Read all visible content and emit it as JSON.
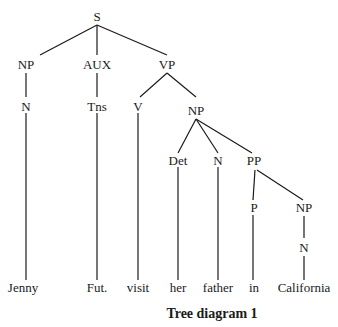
{
  "caption": "Tree diagram 1",
  "nodes": {
    "S": "S",
    "NP1": "NP",
    "AUX": "AUX",
    "VP": "VP",
    "N1": "N",
    "Tns": "Tns",
    "V": "V",
    "NP2": "NP",
    "Det": "Det",
    "N2": "N",
    "PP": "PP",
    "P": "P",
    "NP3": "NP",
    "N3": "N"
  },
  "leaves": {
    "jenny": "Jenny",
    "fut": "Fut.",
    "visit": "visit",
    "her": "her",
    "father": "father",
    "in": "in",
    "california": "California"
  },
  "edges": [
    [
      "S",
      "NP1"
    ],
    [
      "S",
      "AUX"
    ],
    [
      "S",
      "VP"
    ],
    [
      "NP1",
      "N1"
    ],
    [
      "AUX",
      "Tns"
    ],
    [
      "VP",
      "V"
    ],
    [
      "VP",
      "NP2"
    ],
    [
      "N1",
      "jenny"
    ],
    [
      "Tns",
      "fut"
    ],
    [
      "V",
      "visit"
    ],
    [
      "NP2",
      "Det"
    ],
    [
      "NP2",
      "N2"
    ],
    [
      "NP2",
      "PP"
    ],
    [
      "Det",
      "her"
    ],
    [
      "N2",
      "father"
    ],
    [
      "PP",
      "P"
    ],
    [
      "PP",
      "NP3"
    ],
    [
      "P",
      "in"
    ],
    [
      "NP3",
      "N3"
    ],
    [
      "N3",
      "california"
    ]
  ]
}
